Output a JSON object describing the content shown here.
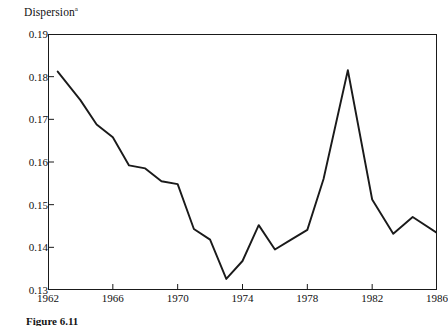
{
  "figure": {
    "caption": "Figure 6.11",
    "y_axis_title": "Dispersion",
    "y_axis_title_superscript": "a"
  },
  "chart_data": {
    "type": "line",
    "title": "Dispersion",
    "xlabel": "",
    "ylabel": "Dispersion",
    "grid": false,
    "legend": "none",
    "line_color": "#1a1a1a",
    "xlim": [
      1962,
      1986
    ],
    "ylim": [
      0.13,
      0.19
    ],
    "x_ticks": [
      1962,
      1966,
      1970,
      1974,
      1978,
      1982,
      1986
    ],
    "y_ticks": [
      0.13,
      0.14,
      0.15,
      0.16,
      0.17,
      0.18,
      0.19
    ],
    "y_tick_labels": [
      "0.13",
      "0.14",
      "0.15",
      "0.16",
      "0.17",
      "0.18",
      "0.19"
    ],
    "x_tick_labels": [
      "1962",
      "1966",
      "1970",
      "1974",
      "1978",
      "1982",
      "1986"
    ],
    "x": [
      1962.6,
      1964.0,
      1965.0,
      1966.0,
      1967.0,
      1968.0,
      1969.0,
      1970.0,
      1971.0,
      1972.0,
      1973.0,
      1974.0,
      1975.0,
      1976.0,
      1977.0,
      1978.0,
      1979.0,
      1980.5,
      1982.0,
      1983.3,
      1984.5,
      1986.0
    ],
    "y": [
      0.1812,
      0.1745,
      0.1688,
      0.1658,
      0.1592,
      0.1585,
      0.1555,
      0.1548,
      0.1443,
      0.1418,
      0.1326,
      0.1368,
      0.1452,
      0.1395,
      0.1418,
      0.1441,
      0.156,
      0.1815,
      0.1512,
      0.1432,
      0.1471,
      0.1434
    ],
    "series": [
      {
        "name": "Dispersion",
        "points": [
          {
            "x": 1962.6,
            "y": 0.1812
          },
          {
            "x": 1964.0,
            "y": 0.1745
          },
          {
            "x": 1965.0,
            "y": 0.1688
          },
          {
            "x": 1966.0,
            "y": 0.1658
          },
          {
            "x": 1967.0,
            "y": 0.1592
          },
          {
            "x": 1968.0,
            "y": 0.1585
          },
          {
            "x": 1969.0,
            "y": 0.1555
          },
          {
            "x": 1970.0,
            "y": 0.1548
          },
          {
            "x": 1971.0,
            "y": 0.1443
          },
          {
            "x": 1972.0,
            "y": 0.1418
          },
          {
            "x": 1973.0,
            "y": 0.1326
          },
          {
            "x": 1974.0,
            "y": 0.1368
          },
          {
            "x": 1975.0,
            "y": 0.1452
          },
          {
            "x": 1976.0,
            "y": 0.1395
          },
          {
            "x": 1977.0,
            "y": 0.1418
          },
          {
            "x": 1978.0,
            "y": 0.1441
          },
          {
            "x": 1979.0,
            "y": 0.156
          },
          {
            "x": 1980.5,
            "y": 0.1815
          },
          {
            "x": 1982.0,
            "y": 0.1512
          },
          {
            "x": 1983.3,
            "y": 0.1432
          },
          {
            "x": 1984.5,
            "y": 0.1471
          },
          {
            "x": 1986.0,
            "y": 0.1434
          }
        ]
      }
    ]
  }
}
